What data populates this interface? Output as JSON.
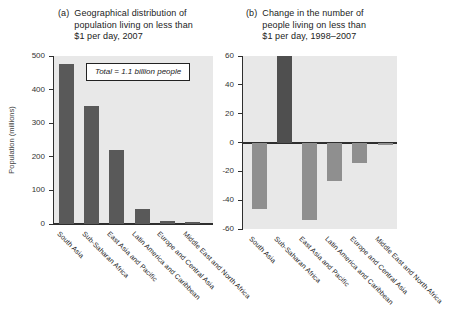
{
  "figure_caption": "Global poverty bar charts",
  "chart_data": [
    {
      "type": "bar",
      "label": "(a)",
      "title": "Geographical distribution of population living on less than $1 per day, 2007",
      "title_lines": [
        "Geographical distribution of",
        "population living on less than",
        "$1 per day, 2007"
      ],
      "ylabel": "Population (millions)",
      "annotation": "Total = 1.1 billion people",
      "categories": [
        "South Asia",
        "Sub-Saharan Africa",
        "East Asia and Pacific",
        "Latin America and Caribbean",
        "Europe and Central Asia",
        "Middle East and North Africa"
      ],
      "values": [
        475,
        350,
        220,
        45,
        10,
        5
      ],
      "ylim": [
        0,
        500
      ],
      "yticks": [
        500,
        400,
        300,
        200,
        100,
        0
      ],
      "grid": false,
      "legend": "none",
      "bar_color": "#595959",
      "negative_bar_color": "#595959",
      "plot_bg": "#e8e8e8",
      "axis_color": "#2e2e2e"
    },
    {
      "type": "bar",
      "label": "(b)",
      "title": "Change in the number of people living on less than $1 per day, 1998–2007",
      "title_lines": [
        "Change in the number of",
        "people living on less than",
        "$1 per day, 1998–2007"
      ],
      "ylabel": "",
      "categories": [
        "South Asia",
        "Sub-Saharan Africa",
        "East Asia and Pacific",
        "Latin America and Caribbean",
        "Europe and Central Asia",
        "Middle East and North Africa"
      ],
      "values": [
        -46,
        60,
        -54,
        -27,
        -14,
        -2
      ],
      "ylim": [
        -60,
        60
      ],
      "yticks": [
        60,
        40,
        20,
        0,
        -20,
        -40,
        -60
      ],
      "grid": false,
      "legend": "none",
      "bar_color": "#4f4f4f",
      "negative_bar_color": "#8f8f8f",
      "plot_bg": "#e8e8e8",
      "axis_color": "#2e2e2e"
    }
  ]
}
